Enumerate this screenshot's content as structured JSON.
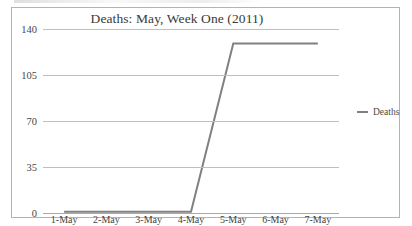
{
  "chart_data": {
    "type": "line",
    "title": "Deaths: May, Week One (2011)",
    "xlabel": "",
    "ylabel": "",
    "categories": [
      "1-May",
      "2-May",
      "3-May",
      "4-May",
      "5-May",
      "6-May",
      "7-May"
    ],
    "series": [
      {
        "name": "Deaths",
        "values": [
          1,
          1,
          1,
          1,
          129,
          129,
          129
        ],
        "color": "#808080"
      }
    ],
    "ylim": [
      0,
      140
    ],
    "yticks": [
      0,
      35,
      70,
      105,
      140
    ],
    "ytick_labels": [
      "0",
      "35",
      "70",
      "105",
      "140"
    ],
    "grid": true,
    "legend": {
      "position": "right",
      "entries": [
        "Deaths"
      ]
    },
    "plot_background": "#ffffff",
    "gridline_color": "#bfbfbf",
    "border_color": "#b3b3b3"
  }
}
